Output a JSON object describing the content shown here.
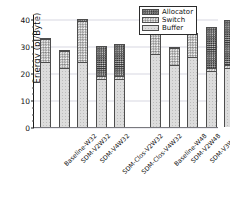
{
  "chart_data": {
    "type": "bar",
    "subtype": "stacked-bar",
    "title": "",
    "xlabel": "",
    "ylabel": "Energy (pJ/Byte)",
    "ylim": [
      0,
      42
    ],
    "yticks": [
      0,
      10,
      20,
      30,
      40
    ],
    "ytick_labels": [
      "0",
      "10",
      "20",
      "30",
      "40"
    ],
    "grid": true,
    "grid_axis": "y",
    "legend_position": "top-right",
    "categories": [
      "Baseline-W32",
      "SDM-V2W32",
      "SDM-V4W32",
      "SDM-Clos-V2W32",
      "SDM-Clos-V4W32",
      "Baseline-W48",
      "SDM-V2W48",
      "SDM-V3W48",
      "SDM-Clos-V2W48",
      "SDM-Clos-V3W48"
    ],
    "series": [
      {
        "name": "Buffer",
        "color": "#dcdcdc",
        "values": [
          24.0,
          22.0,
          24.0,
          18.0,
          18.0,
          27.0,
          23.0,
          26.0,
          21.0,
          22.0
        ]
      },
      {
        "name": "Switch",
        "color": "#a8a8a8",
        "values": [
          8.6,
          6.4,
          15.3,
          0.8,
          1.0,
          10.8,
          6.5,
          8.7,
          1.0,
          1.2
        ]
      },
      {
        "name": "Allocator",
        "color": "#5f5f5f",
        "values": [
          0.4,
          0.4,
          0.7,
          11.2,
          12.0,
          0.4,
          0.3,
          0.3,
          15.0,
          16.5
        ]
      }
    ],
    "totals": [
      33.0,
      28.8,
      40.0,
      30.0,
      31.0,
      38.2,
      29.8,
      35.0,
      37.0,
      39.7
    ]
  },
  "legend": {
    "entries": [
      {
        "label": "Allocator",
        "swatch": "allocator-swatch"
      },
      {
        "label": "Switch",
        "swatch": "switch-swatch"
      },
      {
        "label": "Buffer",
        "swatch": "buffer-swatch"
      }
    ]
  }
}
